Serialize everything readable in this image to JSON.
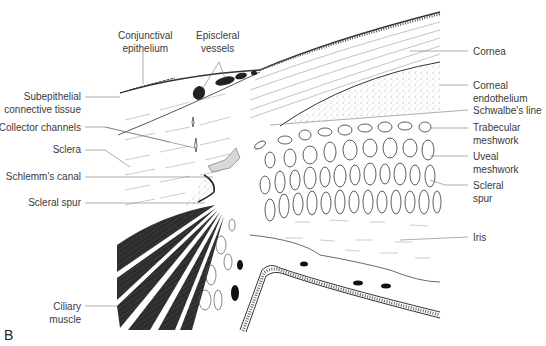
{
  "figure": {
    "panel_letter": "B"
  },
  "labels": {
    "conjunctival_epithelium": [
      "Conjunctival",
      "epithelium"
    ],
    "episcleral_vessels": [
      "Episcleral",
      "vessels"
    ],
    "subepithelial_connective_tissue": [
      "Subepithelial",
      "connective tissue"
    ],
    "collector_channels": [
      "Collector channels"
    ],
    "sclera": [
      "Sclera"
    ],
    "schlemms_canal": [
      "Schlemm's canal"
    ],
    "scleral_spur_left": [
      "Scleral spur"
    ],
    "ciliary_muscle": [
      "Ciliary",
      "muscle"
    ],
    "cornea": [
      "Cornea"
    ],
    "corneal_endothelium": [
      "Corneal",
      "endothelium"
    ],
    "schwalbes_line": [
      "Schwalbe's line"
    ],
    "trabecular_meshwork": [
      "Trabecular",
      "meshwork"
    ],
    "uveal_meshwork": [
      "Uveal",
      "meshwork"
    ],
    "scleral_spur_right": [
      "Scleral",
      "spur"
    ],
    "iris": [
      "Iris"
    ]
  },
  "colors": {
    "line": "#333333",
    "leader": "#777777",
    "muscle": "#2b2b2b",
    "canal_fill": "#d8d8d8",
    "text": "#3a3a3a"
  }
}
